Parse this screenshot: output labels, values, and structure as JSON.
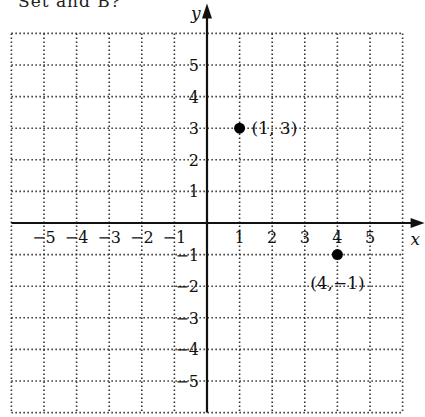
{
  "header": {
    "clipped_text": "Set and B?"
  },
  "chart_data": {
    "type": "scatter",
    "title": "",
    "xlabel": "x",
    "ylabel": "y",
    "xlim": [
      -6,
      6
    ],
    "ylim": [
      -6,
      6
    ],
    "grid": true,
    "grid_style": "dotted",
    "x_ticks": [
      -5,
      -4,
      -3,
      -2,
      -1,
      1,
      2,
      3,
      4,
      5
    ],
    "y_ticks": [
      5,
      4,
      3,
      2,
      1,
      -1,
      -2,
      -3,
      -4,
      -5
    ],
    "x_tick_labels": [
      "−5",
      "−4",
      "−3",
      "−2",
      "−1",
      "1",
      "2",
      "3",
      "4",
      "5"
    ],
    "y_tick_labels": [
      "5",
      "4",
      "3",
      "2",
      "1",
      "−1",
      "−2",
      "−3",
      "−4",
      "−5"
    ],
    "points": [
      {
        "x": 1,
        "y": 3,
        "label": "(1, 3)"
      },
      {
        "x": 4,
        "y": -1,
        "label": "(4,−1)"
      }
    ]
  }
}
